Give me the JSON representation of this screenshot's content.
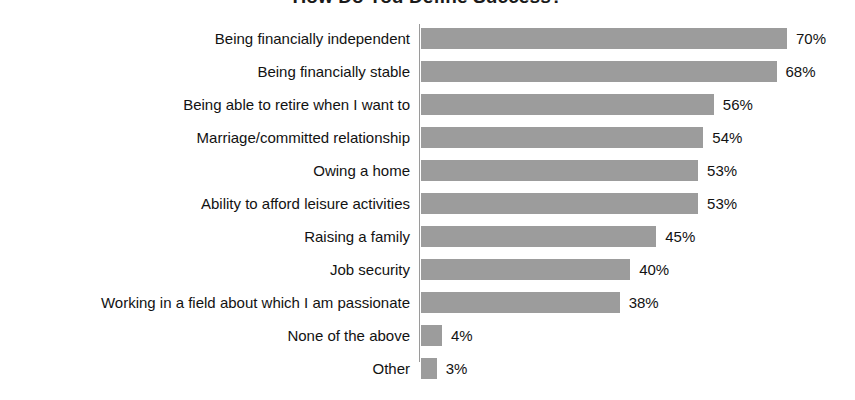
{
  "chart_data": {
    "type": "bar",
    "orientation": "horizontal",
    "title": "How Do You Define Success?",
    "xlabel": "",
    "ylabel": "",
    "xlim": [
      0,
      70
    ],
    "grid": false,
    "legend": null,
    "value_suffix": "%",
    "categories": [
      "Being financially independent",
      "Being financially stable",
      "Being able to retire when I want to",
      "Marriage/committed relationship",
      "Owing a home",
      "Ability to afford leisure activities",
      "Raising a family",
      "Job security",
      "Working in a field about which I am passionate",
      "None of the above",
      "Other"
    ],
    "values": [
      70,
      68,
      56,
      54,
      53,
      53,
      45,
      40,
      38,
      4,
      3
    ],
    "value_labels": [
      "70%",
      "68%",
      "56%",
      "54%",
      "53%",
      "53%",
      "45%",
      "40%",
      "38%",
      "4%",
      "3%"
    ],
    "bar_color": "#9c9c9c",
    "axis_color": "#9a9a9a",
    "text_color": "#121212",
    "background_color": "#ffffff"
  }
}
